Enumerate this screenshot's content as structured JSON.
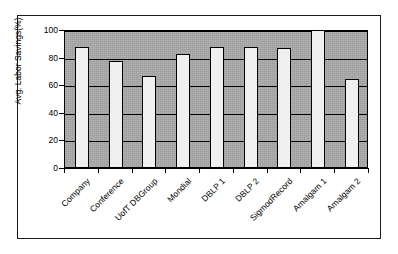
{
  "chart_data": {
    "type": "bar",
    "title": "",
    "xlabel": "",
    "ylabel": "Avg. Labor Savings(%)",
    "ylim": [
      0,
      100
    ],
    "yticks": [
      0,
      20,
      40,
      60,
      80,
      100
    ],
    "grid": true,
    "legend": false,
    "categories": [
      "Company",
      "Conference",
      "UofT DBGroup",
      "Mondial",
      "DBLP 1",
      "DBLP 2",
      "SigmodRecord",
      "Amalgam 1",
      "Amalgam 2"
    ],
    "values": [
      87,
      77,
      66,
      82,
      87,
      87,
      86,
      100,
      64
    ],
    "bar_face_color": "#f2f0ee",
    "bar_edge_color": "#000000",
    "plot_background_color": "#a9a9a9",
    "axis_color": "#000000"
  },
  "axis": {
    "y_title": "Avg. Labor Savings(%)",
    "y_tick_labels": [
      "100",
      "80",
      "60",
      "40",
      "20",
      "0"
    ]
  },
  "frame": {
    "border_color": "#1a1a1a"
  }
}
